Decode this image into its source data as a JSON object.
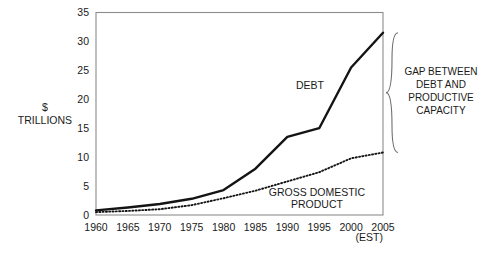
{
  "chart_data": {
    "type": "line",
    "title": "",
    "xlabel": "",
    "ylabel": "$ TRILLIONS",
    "ylabel_lines": [
      "$",
      "TRILLIONS"
    ],
    "x": [
      1960,
      1965,
      1970,
      1975,
      1980,
      1985,
      1990,
      1995,
      2000,
      2005
    ],
    "xlim": [
      1960,
      2005
    ],
    "ylim": [
      0,
      35
    ],
    "yticks": [
      0,
      5,
      10,
      15,
      20,
      25,
      30,
      35
    ],
    "xticks": [
      1960,
      1965,
      1970,
      1975,
      1980,
      1985,
      1990,
      1995,
      2000,
      2005
    ],
    "xtick_labels": [
      "1960",
      "1965",
      "1970",
      "1975",
      "1980",
      "1985",
      "1990",
      "1995",
      "2000",
      "2005"
    ],
    "ytick_labels": [
      "0",
      "5",
      "10",
      "15",
      "20",
      "25",
      "30",
      "35"
    ],
    "x_axis_note": "(EST)",
    "grid": false,
    "legend": "inline-labels",
    "series": [
      {
        "name": "DEBT",
        "style": "solid",
        "label": "DEBT",
        "values": [
          0.8,
          1.3,
          1.9,
          2.8,
          4.3,
          8.0,
          13.5,
          15.0,
          25.5,
          31.5
        ]
      },
      {
        "name": "GROSS DOMESTIC PRODUCT",
        "style": "dotted",
        "label_lines": [
          "GROSS DOMESTIC",
          "PRODUCT"
        ],
        "values": [
          0.5,
          0.7,
          1.0,
          1.7,
          2.9,
          4.2,
          5.8,
          7.4,
          9.8,
          10.8
        ]
      }
    ],
    "annotations": [
      {
        "name": "gap-annotation",
        "lines": [
          "GAP BETWEEN",
          "DEBT AND",
          "PRODUCTIVE",
          "CAPACITY"
        ],
        "marker": "curly-brace",
        "from_value": 31.5,
        "to_value": 10.8
      }
    ],
    "colors": {
      "debt_line": "#141414",
      "gdp_line": "#141414",
      "frame": "#8c8c8c",
      "brace": "#6e6e6e",
      "text": "#1a1a1a",
      "background": "#ffffff"
    }
  }
}
